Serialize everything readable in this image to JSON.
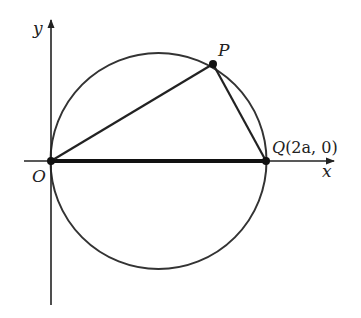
{
  "diagram": {
    "type": "geometry",
    "axes": {
      "x_label": "x",
      "y_label": "y"
    },
    "points": {
      "O": {
        "label": "O"
      },
      "P": {
        "label": "P"
      },
      "Q": {
        "label_letter": "Q",
        "label_coords": "(2a, 0)",
        "label": "Q(2a, 0)"
      }
    },
    "segments": [
      "OP",
      "PQ",
      "OQ"
    ],
    "colors": {
      "line": "#222222",
      "circle": "#333333",
      "background": "#ffffff"
    }
  }
}
